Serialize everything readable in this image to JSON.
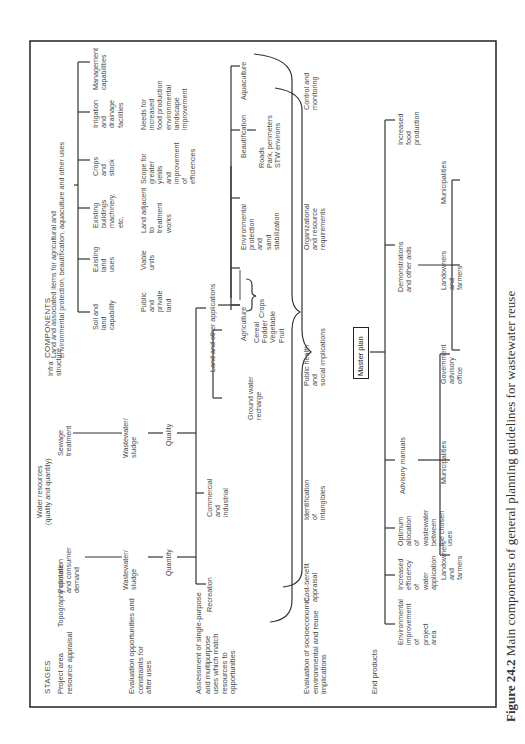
{
  "figure": {
    "caption_number": "Figure 24.2",
    "caption_text": " Main components of general planning guidelines for wastewater reuse",
    "orientation": "rotated 90° counter-clockwise"
  },
  "headers": {
    "stages": "STAGES",
    "components": "COMPONENTS"
  },
  "stages": [
    {
      "label": "Project area\nresource appraisal"
    },
    {
      "label": "Evaluation opportunities and\nconstraints for\nafter uses"
    },
    {
      "label": "Assessment of single-purpose\nand multipurpose\nuses which match\nresources to\nopportunities"
    },
    {
      "label": "Evaluation of socioeconomic,\nenvironmental and reuse\nimplications"
    },
    {
      "label": "End products"
    }
  ],
  "row1": {
    "topography": "Topography climate",
    "water_resources": "Water resources\n(quality and quantity)",
    "population": "Population\nand consumer\ndemand",
    "sewage": "Sewage\ntreatment",
    "infrastructure": "Infra\nstructure",
    "land_items": "Land and associated items for agricultural and\nenvironmental protection, beautification, aquaculture and other uses",
    "land_children": [
      {
        "label": "Soil and\nland\ncapability"
      },
      {
        "label": "Existing\nland\nuses"
      },
      {
        "label": "Existing\nbuildings\nmachinery,\netc."
      },
      {
        "label": "Crops\nand\nstock"
      },
      {
        "label": "Irrigation\nand\ndrainage\nfacilities"
      },
      {
        "label": "Management\ncapabilities"
      }
    ]
  },
  "row2": {
    "wastewater_a": "Wastewater/\nsludge",
    "wastewater_b": "Wastewater/\nsludge",
    "constraints": [
      {
        "label": "Public\nand\nprivate\nland"
      },
      {
        "label": "Viable\nunits"
      },
      {
        "label": "Land adjacent\nto\ntreatment\nworks"
      },
      {
        "label": "Scope for\ngreater\nyields\nand\nimprovement\nof\nefficiencies"
      },
      {
        "label": "Needs for\nincreased\nfood production\nenvironmental\nlandscape\nimprovement"
      }
    ]
  },
  "row3": {
    "quantity": "Quantity",
    "quality": "Quality",
    "recreation": "Recreation",
    "commercial": "Commercial\nand\nindustrial",
    "land_other": "Land and other applications",
    "ground_water": "Ground water\nrecharge",
    "agriculture": "Agriculture",
    "crops_list": "Cereal\nFodder\nVegetable\nFruit",
    "crops": "Crops",
    "environmental": "Environmental\nprotection\nand\nsand\nstabilization",
    "beautification": "Beautification",
    "beautification_list": "Roads\nPark, perimeters\nSTW environs",
    "aquaculture": "Aquaculture"
  },
  "row4": {
    "cost_benefit": "Cost-benefit\nappraisal",
    "intangibles": "Identification\nof\nintangibles",
    "public_health": "Public health\nand\nsocial implications",
    "organizational": "Organizational\nand resource\nrequirements",
    "control": "Control and\nmonitoring"
  },
  "master_plan": "Master plan",
  "end_products": {
    "items": [
      {
        "label": "Environmental\nimprovement\nof\nproject\narea"
      },
      {
        "label": "Increased\nefficiency\nof\nwater\napplication"
      },
      {
        "label": "Optimum\nallocation\nof\nwastewater\nbetween\nthe chosen\nuses"
      },
      {
        "label": "Advisory manuals"
      },
      {
        "label": "Demonstrations\nand other aids"
      },
      {
        "label": "Increased\nfood\nproduction"
      }
    ],
    "advisory_children": [
      {
        "label": "Landowners\nand\nfarmers"
      },
      {
        "label": "Municipalities"
      },
      {
        "label": "Government\nadvisory\noffice"
      }
    ],
    "demonstration_children": [
      {
        "label": "Landowners\nand\nfarmers"
      },
      {
        "label": "Municipalities"
      }
    ]
  },
  "colors": {
    "ink": "#3a3a3a",
    "frame": "#222222",
    "background": "#ffffff"
  }
}
